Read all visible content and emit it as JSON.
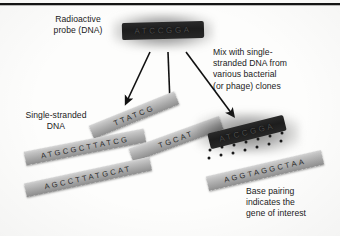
{
  "figure": {
    "title_rule": "horizontal-rule",
    "background_color": "#fdfdfc",
    "ink_color": "#1a1a1a"
  },
  "captions": {
    "probe_label": "Radioactive\nprobe (DNA)",
    "mix_label": "Mix with single-\nstranded DNA from\nvarious bacterial\n(or phage) clones",
    "ssdna_label": "Single-stranded\nDNA",
    "basepair_label": "Base pairing\nindicates the\ngene of interest"
  },
  "probe": {
    "sequence": "ATCCGGA",
    "fill_color": "#1d1d1d",
    "glow_color": "#2a2a2a",
    "letter_color": "#4e4e4e"
  },
  "hybrid_probe": {
    "sequence": "ATCCGGA",
    "fill_color": "#1d1d1d"
  },
  "strands": [
    {
      "name": "strand-ttatcg",
      "sequence": "TTATCG"
    },
    {
      "name": "strand-atgcgcttatcg",
      "sequence": "ATGCGCTTATCG"
    },
    {
      "name": "strand-tgcat",
      "sequence": "TGCAT"
    },
    {
      "name": "strand-agccttatgcat",
      "sequence": "AGCCTTATGCAT"
    }
  ],
  "hybrid_strand": {
    "name": "strand-aggtaggctaa",
    "sequence": "AGGTAGGCTAA"
  },
  "arrows": {
    "count": 3,
    "color": "#111111",
    "label": "mixing-arrows"
  },
  "base_pairing_dots": {
    "count": 14,
    "color": "#1a1a1a"
  },
  "colors": {
    "strand_light": "#d6d6d6",
    "strand_dark": "#8e8e8e",
    "rule": "#141414"
  }
}
